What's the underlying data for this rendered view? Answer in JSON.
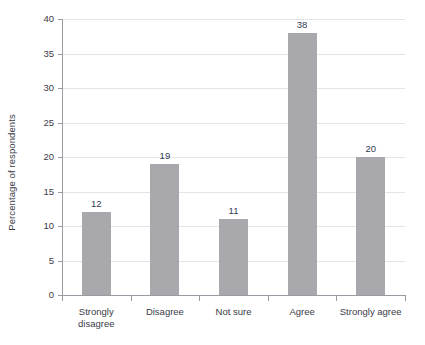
{
  "chart_data": {
    "type": "bar",
    "title": "",
    "subtitle": "",
    "xlabel": "",
    "ylabel": "Percentage of respondents",
    "categories": [
      "Strongly\ndisagree",
      "Disagree",
      "Not sure",
      "Agree",
      "Strongly agree"
    ],
    "category_labels_flat": [
      "Strongly disagree",
      "Disagree",
      "Not sure",
      "Agree",
      "Strongly agree"
    ],
    "values": [
      12,
      19,
      11,
      38,
      20
    ],
    "value_labels": [
      "12",
      "19",
      "11",
      "38",
      "20"
    ],
    "ylim": [
      0,
      40
    ],
    "ytick_values": [
      0,
      5,
      10,
      15,
      20,
      25,
      30,
      35,
      40
    ],
    "ytick_labels": [
      "0",
      "5",
      "10",
      "15",
      "20",
      "25",
      "30",
      "35",
      "40"
    ],
    "grid": "horizontal",
    "legend": "none",
    "annotations": [],
    "colors": {
      "bar_fill": "#a9a9ad",
      "gridline": "#e3e3e8",
      "axis_line": "#9a9aa2",
      "tick_text": "#3b3b46",
      "value_label": "#2f3b52",
      "background": "#ffffff"
    }
  }
}
